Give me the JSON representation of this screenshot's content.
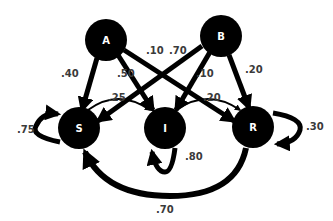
{
  "diagram": {
    "type": "state-transition",
    "nodes": [
      {
        "id": "A",
        "label": "A",
        "x": 106,
        "y": 40
      },
      {
        "id": "B",
        "label": "B",
        "x": 221,
        "y": 36
      },
      {
        "id": "S",
        "label": "S",
        "x": 79,
        "y": 128
      },
      {
        "id": "I",
        "label": "I",
        "x": 165,
        "y": 128
      },
      {
        "id": "R",
        "label": "R",
        "x": 253,
        "y": 127
      }
    ],
    "edges": [
      {
        "from": "A",
        "to": "S",
        "label": ".40"
      },
      {
        "from": "A",
        "to": "I",
        "label": ".50"
      },
      {
        "from": "A",
        "to": "R",
        "label": ".10"
      },
      {
        "from": "B",
        "to": "S",
        "label": ".70"
      },
      {
        "from": "B",
        "to": "I",
        "label": ".10"
      },
      {
        "from": "B",
        "to": "R",
        "label": ".20"
      },
      {
        "from": "S",
        "to": "I",
        "label": ".25"
      },
      {
        "from": "I",
        "to": "R",
        "label": ".20"
      },
      {
        "from": "S",
        "to": "S",
        "label": ".75"
      },
      {
        "from": "I",
        "to": "I",
        "label": ".80"
      },
      {
        "from": "R",
        "to": "R",
        "label": ".30"
      },
      {
        "from": "R",
        "to": "S",
        "label": ".70"
      }
    ],
    "colors": {
      "node": "#000000",
      "edge": "#000000",
      "node_text": "#ffffff",
      "label_text": "#3a3a3a"
    }
  }
}
